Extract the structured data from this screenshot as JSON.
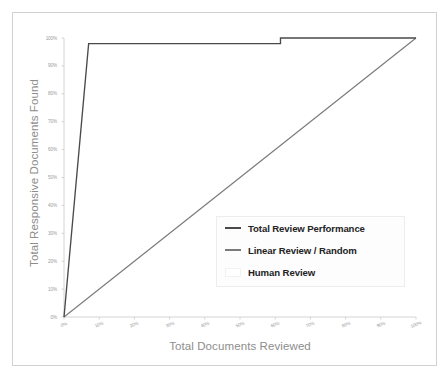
{
  "chart_data": {
    "type": "line",
    "title": "",
    "xlabel": "Total Documents Reviewed",
    "ylabel": "Total Responsive Documents Found",
    "xlim": [
      0,
      100
    ],
    "ylim": [
      0,
      100
    ],
    "grid": false,
    "legend_position": "center-right",
    "x_tick_labels": [
      "0%",
      "10%",
      "20%",
      "30%",
      "40%",
      "50%",
      "60%",
      "70%",
      "80%",
      "90%",
      "100%"
    ],
    "x_tick_values": [
      0,
      10,
      20,
      30,
      40,
      50,
      60,
      70,
      80,
      90,
      100
    ],
    "y_tick_labels": [
      "0%",
      "10%",
      "20%",
      "30%",
      "40%",
      "50%",
      "60%",
      "70%",
      "80%",
      "90%",
      "100%"
    ],
    "y_tick_values": [
      0,
      10,
      20,
      30,
      40,
      50,
      60,
      70,
      80,
      90,
      100
    ],
    "series": [
      {
        "name": "Total Review Performance",
        "color": "#4a4a4a",
        "points": [
          [
            0,
            0
          ],
          [
            7,
            98
          ],
          [
            61.5,
            98
          ],
          [
            61.5,
            100
          ],
          [
            100,
            100
          ]
        ]
      },
      {
        "name": "Linear Review / Random",
        "color": "#7a7a7a",
        "points": [
          [
            0,
            0
          ],
          [
            100,
            100
          ]
        ]
      },
      {
        "name": "Human Review",
        "color": "#ffffff",
        "points": []
      }
    ]
  },
  "legend": {
    "items": [
      {
        "label": "Total Review Performance",
        "marker": "line-dark"
      },
      {
        "label": "Linear Review / Random",
        "marker": "line-gray"
      },
      {
        "label": "Human Review",
        "marker": "box-white"
      }
    ]
  },
  "axes": {
    "y_title": "Total Responsive Documents Found",
    "x_title": "Total Documents Reviewed",
    "y_ticks": [
      "100%",
      "90%",
      "80%",
      "70%",
      "60%",
      "50%",
      "40%",
      "30%",
      "20%",
      "10%",
      "0%"
    ],
    "x_ticks": [
      "0%",
      "10%",
      "20%",
      "30%",
      "40%",
      "50%",
      "60%",
      "70%",
      "80%",
      "90%",
      "100%"
    ]
  },
  "colors": {
    "frame": "#d2d2d2",
    "axis": "#c9c9c9",
    "tick_text": "#9a9a9a",
    "axis_title": "#8d8d8d",
    "performance_line": "#4a4a4a",
    "linear_line": "#7a7a7a",
    "legend_text": "#232323"
  }
}
